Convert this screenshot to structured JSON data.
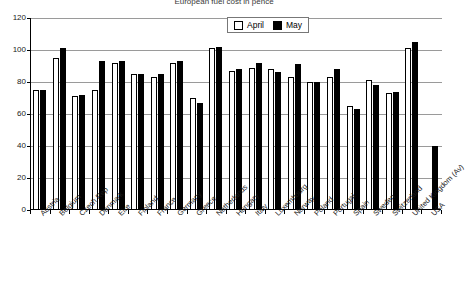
{
  "chart_data": {
    "type": "bar",
    "title": "European fuel cost in pence",
    "xlabel": "",
    "ylabel": "",
    "ylim": [
      0,
      120
    ],
    "ytick_step": 20,
    "yticks": [
      0,
      20,
      40,
      60,
      80,
      100,
      120
    ],
    "grid": true,
    "legend_position": "top-center",
    "categories": [
      "Austria",
      "Belgium",
      "Czech Rep",
      "Denmark",
      "Eire",
      "Finland",
      "France",
      "Germany",
      "Greece",
      "Netherlands",
      "Hungary",
      "Italy",
      "Luxembourg",
      "Norway",
      "Poland",
      "Portugal",
      "Spain",
      "Sweden",
      "Switzerland",
      "United Kingdom (Av)",
      "USA"
    ],
    "series": [
      {
        "name": "April",
        "color": "#ffffff",
        "values": [
          75,
          95,
          71,
          75,
          92,
          85,
          83,
          92,
          70,
          101,
          87,
          89,
          88,
          83,
          80,
          83,
          65,
          81,
          73,
          101,
          null
        ]
      },
      {
        "name": "May",
        "color": "#000000",
        "values": [
          75,
          101,
          72,
          93,
          93,
          85,
          85,
          93,
          67,
          102,
          88,
          92,
          86,
          91,
          80,
          88,
          63,
          78,
          74,
          105,
          40
        ]
      }
    ]
  },
  "legend": {
    "items": [
      {
        "label": "April",
        "swatch": "white-square-icon"
      },
      {
        "label": "May",
        "swatch": "black-square-icon"
      }
    ]
  }
}
